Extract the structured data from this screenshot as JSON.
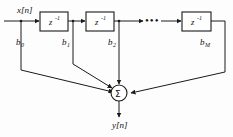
{
  "diagram": {
    "type": "signal-flow-graph",
    "background_color": "#fdfdfd",
    "line_color": "#1a1a1a",
    "input": {
      "label": "x[n]",
      "var": "x",
      "index": "[n]"
    },
    "output": {
      "label": "y[n]",
      "var": "y",
      "index": "[n]"
    },
    "delay_blocks": [
      {
        "id": "delay-1",
        "label": "z",
        "exponent": "-1",
        "full_label": "z⁻¹"
      },
      {
        "id": "delay-2",
        "label": "z",
        "exponent": "-1",
        "full_label": "z⁻¹"
      },
      {
        "id": "delay-3",
        "label": "z",
        "exponent": "-1",
        "full_label": "z⁻¹"
      }
    ],
    "ellipsis": "•••",
    "coefficients": [
      {
        "id": "coef-b0",
        "base": "b",
        "subscript": "0",
        "label": "b₀"
      },
      {
        "id": "coef-b1",
        "base": "b",
        "subscript": "1",
        "label": "b₁"
      },
      {
        "id": "coef-b2",
        "base": "b",
        "subscript": "2",
        "label": "b₂"
      },
      {
        "id": "coef-bM",
        "base": "b",
        "subscript": "M",
        "label": "bₘ"
      }
    ],
    "summation": {
      "symbol": "Σ",
      "name": "summing-junction",
      "input_count": 4
    }
  }
}
